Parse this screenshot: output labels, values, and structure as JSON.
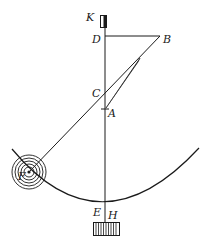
{
  "diagram": {
    "labels": {
      "K": "K",
      "D": "D",
      "B": "B",
      "C": "C",
      "A": "A",
      "F": "F",
      "E": "E",
      "H": "H"
    },
    "colors": {
      "ink": "#1a1a1a",
      "background": "#ffffff"
    }
  }
}
